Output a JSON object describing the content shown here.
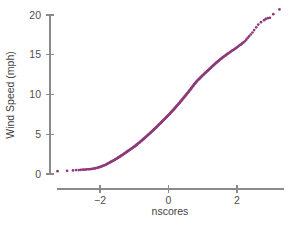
{
  "chart_data": {
    "type": "scatter",
    "title": "",
    "subtitle": "",
    "xlabel": "nscores",
    "ylabel": "Wind Speed (mph)",
    "xlim": [
      -3.55,
      3.55
    ],
    "ylim": [
      -0.6,
      21.6
    ],
    "xticks": [
      -2,
      0,
      2
    ],
    "xticklabels": [
      "−2",
      "0",
      "2"
    ],
    "yticks": [
      0,
      5,
      10,
      15,
      20
    ],
    "yticklabels": [
      "0",
      "5",
      "10",
      "15",
      "20"
    ],
    "grid": false,
    "legend": null,
    "legend_position": "none",
    "marker": "point",
    "marker_size": 1.35,
    "series": [
      {
        "name": "Wind Speed",
        "color": "#8e3a79",
        "points": [
          [
            -3.24,
            0.35
          ],
          [
            -2.96,
            0.4
          ],
          [
            -2.79,
            0.45
          ],
          [
            -2.7,
            0.5
          ],
          [
            -2.62,
            0.5
          ],
          [
            -2.56,
            0.52
          ],
          [
            -2.5,
            0.55
          ],
          [
            -2.45,
            0.55
          ],
          [
            -2.4,
            0.58
          ],
          [
            -2.35,
            0.6
          ],
          [
            -2.31,
            0.6
          ],
          [
            -2.27,
            0.62
          ],
          [
            -2.23,
            0.65
          ],
          [
            -2.19,
            0.68
          ],
          [
            -2.15,
            0.7
          ],
          [
            -2.12,
            0.74
          ],
          [
            -2.08,
            0.78
          ],
          [
            -2.05,
            0.82
          ],
          [
            -2.02,
            0.86
          ],
          [
            -1.99,
            0.9
          ],
          [
            -1.96,
            0.95
          ],
          [
            -1.93,
            1.0
          ],
          [
            -1.9,
            1.05
          ],
          [
            -1.87,
            1.1
          ],
          [
            -1.84,
            1.16
          ],
          [
            -1.81,
            1.22
          ],
          [
            -1.79,
            1.28
          ],
          [
            -1.76,
            1.34
          ],
          [
            -1.73,
            1.4
          ],
          [
            -1.71,
            1.46
          ],
          [
            -1.68,
            1.52
          ],
          [
            -1.66,
            1.58
          ],
          [
            -1.63,
            1.64
          ],
          [
            -1.61,
            1.7
          ],
          [
            -1.58,
            1.76
          ],
          [
            -1.56,
            1.82
          ],
          [
            -1.54,
            1.88
          ],
          [
            -1.51,
            1.94
          ],
          [
            -1.49,
            2.0
          ],
          [
            -1.47,
            2.06
          ],
          [
            -1.45,
            2.12
          ],
          [
            -1.42,
            2.18
          ],
          [
            -1.4,
            2.24
          ],
          [
            -1.38,
            2.3
          ],
          [
            -1.36,
            2.36
          ],
          [
            -1.34,
            2.42
          ],
          [
            -1.32,
            2.48
          ],
          [
            -1.3,
            2.54
          ],
          [
            -1.28,
            2.6
          ],
          [
            -1.26,
            2.66
          ],
          [
            -1.24,
            2.72
          ],
          [
            -1.22,
            2.78
          ],
          [
            -1.2,
            2.84
          ],
          [
            -1.18,
            2.9
          ],
          [
            -1.16,
            2.96
          ],
          [
            -1.14,
            3.02
          ],
          [
            -1.12,
            3.08
          ],
          [
            -1.1,
            3.14
          ],
          [
            -1.08,
            3.2
          ],
          [
            -1.06,
            3.26
          ],
          [
            -1.04,
            3.32
          ],
          [
            -1.02,
            3.38
          ],
          [
            -1.0,
            3.44
          ],
          [
            -0.98,
            3.5
          ],
          [
            -0.96,
            3.57
          ],
          [
            -0.94,
            3.63
          ],
          [
            -0.93,
            3.7
          ],
          [
            -0.91,
            3.76
          ],
          [
            -0.89,
            3.83
          ],
          [
            -0.87,
            3.89
          ],
          [
            -0.85,
            3.96
          ],
          [
            -0.83,
            4.02
          ],
          [
            -0.82,
            4.09
          ],
          [
            -0.8,
            4.15
          ],
          [
            -0.78,
            4.22
          ],
          [
            -0.76,
            4.28
          ],
          [
            -0.74,
            4.35
          ],
          [
            -0.73,
            4.42
          ],
          [
            -0.71,
            4.48
          ],
          [
            -0.69,
            4.55
          ],
          [
            -0.67,
            4.62
          ],
          [
            -0.66,
            4.68
          ],
          [
            -0.64,
            4.75
          ],
          [
            -0.62,
            4.82
          ],
          [
            -0.6,
            4.89
          ],
          [
            -0.59,
            4.96
          ],
          [
            -0.57,
            5.02
          ],
          [
            -0.55,
            5.09
          ],
          [
            -0.53,
            5.16
          ],
          [
            -0.52,
            5.23
          ],
          [
            -0.5,
            5.3
          ],
          [
            -0.48,
            5.37
          ],
          [
            -0.46,
            5.44
          ],
          [
            -0.45,
            5.51
          ],
          [
            -0.43,
            5.58
          ],
          [
            -0.41,
            5.65
          ],
          [
            -0.4,
            5.72
          ],
          [
            -0.38,
            5.79
          ],
          [
            -0.36,
            5.86
          ],
          [
            -0.34,
            5.93
          ],
          [
            -0.33,
            6.0
          ],
          [
            -0.31,
            6.07
          ],
          [
            -0.29,
            6.15
          ],
          [
            -0.28,
            6.22
          ],
          [
            -0.26,
            6.29
          ],
          [
            -0.24,
            6.36
          ],
          [
            -0.22,
            6.44
          ],
          [
            -0.21,
            6.51
          ],
          [
            -0.19,
            6.58
          ],
          [
            -0.17,
            6.66
          ],
          [
            -0.16,
            6.73
          ],
          [
            -0.14,
            6.81
          ],
          [
            -0.12,
            6.88
          ],
          [
            -0.1,
            6.96
          ],
          [
            -0.09,
            7.03
          ],
          [
            -0.07,
            7.11
          ],
          [
            -0.05,
            7.19
          ],
          [
            -0.04,
            7.26
          ],
          [
            -0.02,
            7.34
          ],
          [
            0.0,
            7.42
          ],
          [
            0.02,
            7.5
          ],
          [
            0.04,
            7.58
          ],
          [
            0.05,
            7.66
          ],
          [
            0.07,
            7.74
          ],
          [
            0.09,
            7.82
          ],
          [
            0.1,
            7.9
          ],
          [
            0.12,
            7.98
          ],
          [
            0.14,
            8.06
          ],
          [
            0.16,
            8.14
          ],
          [
            0.17,
            8.22
          ],
          [
            0.19,
            8.31
          ],
          [
            0.21,
            8.39
          ],
          [
            0.22,
            8.47
          ],
          [
            0.24,
            8.56
          ],
          [
            0.26,
            8.64
          ],
          [
            0.28,
            8.73
          ],
          [
            0.29,
            8.81
          ],
          [
            0.31,
            8.9
          ],
          [
            0.33,
            8.99
          ],
          [
            0.34,
            9.07
          ],
          [
            0.36,
            9.16
          ],
          [
            0.38,
            9.25
          ],
          [
            0.4,
            9.34
          ],
          [
            0.41,
            9.43
          ],
          [
            0.43,
            9.52
          ],
          [
            0.45,
            9.61
          ],
          [
            0.46,
            9.7
          ],
          [
            0.48,
            9.79
          ],
          [
            0.5,
            9.88
          ],
          [
            0.52,
            9.97
          ],
          [
            0.53,
            10.07
          ],
          [
            0.55,
            10.16
          ],
          [
            0.57,
            10.25
          ],
          [
            0.59,
            10.35
          ],
          [
            0.6,
            10.44
          ],
          [
            0.62,
            10.54
          ],
          [
            0.64,
            10.64
          ],
          [
            0.66,
            10.73
          ],
          [
            0.67,
            10.83
          ],
          [
            0.69,
            10.93
          ],
          [
            0.71,
            11.03
          ],
          [
            0.73,
            11.13
          ],
          [
            0.74,
            11.23
          ],
          [
            0.76,
            11.33
          ],
          [
            0.78,
            11.43
          ],
          [
            0.8,
            11.53
          ],
          [
            0.82,
            11.62
          ],
          [
            0.83,
            11.7
          ],
          [
            0.85,
            11.78
          ],
          [
            0.87,
            11.86
          ],
          [
            0.89,
            11.94
          ],
          [
            0.91,
            12.02
          ],
          [
            0.93,
            12.1
          ],
          [
            0.94,
            12.18
          ],
          [
            0.96,
            12.26
          ],
          [
            0.98,
            12.34
          ],
          [
            1.0,
            12.42
          ],
          [
            1.02,
            12.5
          ],
          [
            1.04,
            12.58
          ],
          [
            1.06,
            12.66
          ],
          [
            1.08,
            12.74
          ],
          [
            1.1,
            12.82
          ],
          [
            1.12,
            12.9
          ],
          [
            1.14,
            12.98
          ],
          [
            1.16,
            13.06
          ],
          [
            1.18,
            13.14
          ],
          [
            1.2,
            13.22
          ],
          [
            1.22,
            13.3
          ],
          [
            1.24,
            13.38
          ],
          [
            1.26,
            13.46
          ],
          [
            1.28,
            13.54
          ],
          [
            1.3,
            13.62
          ],
          [
            1.32,
            13.7
          ],
          [
            1.34,
            13.78
          ],
          [
            1.36,
            13.86
          ],
          [
            1.38,
            13.94
          ],
          [
            1.4,
            14.02
          ],
          [
            1.42,
            14.1
          ],
          [
            1.45,
            14.18
          ],
          [
            1.47,
            14.26
          ],
          [
            1.49,
            14.34
          ],
          [
            1.51,
            14.42
          ],
          [
            1.54,
            14.5
          ],
          [
            1.56,
            14.58
          ],
          [
            1.58,
            14.66
          ],
          [
            1.61,
            14.74
          ],
          [
            1.63,
            14.82
          ],
          [
            1.66,
            14.9
          ],
          [
            1.68,
            14.98
          ],
          [
            1.71,
            15.06
          ],
          [
            1.73,
            15.14
          ],
          [
            1.76,
            15.22
          ],
          [
            1.79,
            15.3
          ],
          [
            1.81,
            15.38
          ],
          [
            1.84,
            15.46
          ],
          [
            1.87,
            15.55
          ],
          [
            1.9,
            15.63
          ],
          [
            1.93,
            15.72
          ],
          [
            1.96,
            15.8
          ],
          [
            1.99,
            15.9
          ],
          [
            2.02,
            16.0
          ],
          [
            2.05,
            16.1
          ],
          [
            2.08,
            16.2
          ],
          [
            2.12,
            16.3
          ],
          [
            2.15,
            16.42
          ],
          [
            2.19,
            16.55
          ],
          [
            2.23,
            16.7
          ],
          [
            2.27,
            16.9
          ],
          [
            2.31,
            17.1
          ],
          [
            2.35,
            17.3
          ],
          [
            2.4,
            17.55
          ],
          [
            2.45,
            17.8
          ],
          [
            2.5,
            18.1
          ],
          [
            2.56,
            18.45
          ],
          [
            2.62,
            18.8
          ],
          [
            2.7,
            19.1
          ],
          [
            2.79,
            19.35
          ],
          [
            2.84,
            19.5
          ],
          [
            2.9,
            19.6
          ],
          [
            2.96,
            19.65
          ],
          [
            3.06,
            20.1
          ],
          [
            3.24,
            20.7
          ]
        ]
      }
    ]
  },
  "axes": {
    "x_axis_name": "x-axis",
    "y_axis_name": "y-axis",
    "axis_color": "#8a8a8a",
    "tick_label_color": "#4f4f4f"
  },
  "colors": {
    "background": "#ffffff",
    "data": "#8e3a79",
    "axis": "#8a8a8a"
  }
}
